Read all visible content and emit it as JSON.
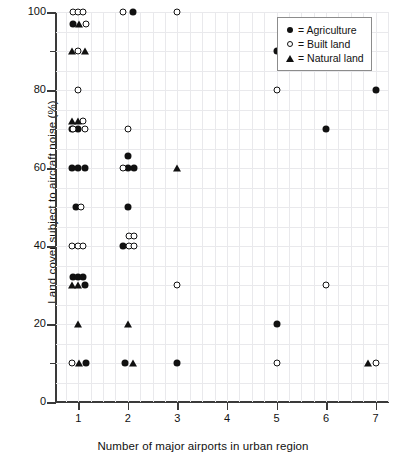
{
  "chart_data": {
    "type": "scatter",
    "title": "",
    "xlabel": "Number of major airports in urban region",
    "ylabel": "Land cover subject to aircraft noise (%)",
    "xlim": [
      0.55,
      7.25
    ],
    "ylim": [
      0,
      100
    ],
    "grid": true,
    "x_ticks": [
      1,
      2,
      3,
      4,
      5,
      6,
      7
    ],
    "x_tick_labels": [
      "1",
      "2",
      "3",
      "4",
      "5",
      "6",
      "7"
    ],
    "y_ticks": [
      0,
      20,
      40,
      60,
      80,
      100
    ],
    "y_tick_labels": [
      "0",
      "20",
      "40",
      "60",
      "80",
      "100"
    ],
    "y_minor_ticks": [
      10,
      30,
      50,
      70,
      90
    ],
    "legend_position": "top-right",
    "series": [
      {
        "name": "Agriculture",
        "marker": "filled-circle",
        "color": "#111111",
        "points": [
          {
            "x": 0.9,
            "y": 97
          },
          {
            "x": 0.87,
            "y": 70
          },
          {
            "x": 1.0,
            "y": 70
          },
          {
            "x": 0.87,
            "y": 60
          },
          {
            "x": 1.0,
            "y": 60
          },
          {
            "x": 1.13,
            "y": 60
          },
          {
            "x": 0.95,
            "y": 50
          },
          {
            "x": 0.9,
            "y": 32
          },
          {
            "x": 1.0,
            "y": 32
          },
          {
            "x": 1.1,
            "y": 32
          },
          {
            "x": 1.13,
            "y": 30
          },
          {
            "x": 1.15,
            "y": 10
          },
          {
            "x": 2.1,
            "y": 100
          },
          {
            "x": 2.0,
            "y": 63
          },
          {
            "x": 2.0,
            "y": 60
          },
          {
            "x": 2.12,
            "y": 60
          },
          {
            "x": 2.0,
            "y": 50
          },
          {
            "x": 1.9,
            "y": 40
          },
          {
            "x": 1.95,
            "y": 10
          },
          {
            "x": 3.0,
            "y": 10
          },
          {
            "x": 5.0,
            "y": 90
          },
          {
            "x": 5.0,
            "y": 20
          },
          {
            "x": 6.0,
            "y": 70
          },
          {
            "x": 7.0,
            "y": 80
          }
        ]
      },
      {
        "name": "Built land",
        "marker": "open-circle",
        "color": "#111111",
        "points": [
          {
            "x": 0.9,
            "y": 100
          },
          {
            "x": 1.0,
            "y": 100
          },
          {
            "x": 1.1,
            "y": 100
          },
          {
            "x": 1.15,
            "y": 97
          },
          {
            "x": 1.0,
            "y": 90
          },
          {
            "x": 1.0,
            "y": 80
          },
          {
            "x": 1.1,
            "y": 72
          },
          {
            "x": 0.9,
            "y": 70
          },
          {
            "x": 1.13,
            "y": 70
          },
          {
            "x": 1.05,
            "y": 50
          },
          {
            "x": 0.88,
            "y": 40
          },
          {
            "x": 0.99,
            "y": 40
          },
          {
            "x": 1.1,
            "y": 40
          },
          {
            "x": 0.88,
            "y": 10
          },
          {
            "x": 1.9,
            "y": 100
          },
          {
            "x": 2.0,
            "y": 70
          },
          {
            "x": 1.9,
            "y": 60
          },
          {
            "x": 2.02,
            "y": 42.5
          },
          {
            "x": 2.12,
            "y": 42.5
          },
          {
            "x": 2.02,
            "y": 40
          },
          {
            "x": 2.13,
            "y": 40
          },
          {
            "x": 3.0,
            "y": 100
          },
          {
            "x": 3.0,
            "y": 30
          },
          {
            "x": 5.0,
            "y": 80
          },
          {
            "x": 5.0,
            "y": 10
          },
          {
            "x": 6.0,
            "y": 30
          },
          {
            "x": 7.0,
            "y": 10
          }
        ]
      },
      {
        "name": "Natural land",
        "marker": "filled-triangle",
        "color": "#111111",
        "points": [
          {
            "x": 1.02,
            "y": 97
          },
          {
            "x": 0.88,
            "y": 90
          },
          {
            "x": 1.13,
            "y": 90
          },
          {
            "x": 0.88,
            "y": 72
          },
          {
            "x": 1.0,
            "y": 72
          },
          {
            "x": 0.88,
            "y": 30
          },
          {
            "x": 1.0,
            "y": 30
          },
          {
            "x": 1.0,
            "y": 20
          },
          {
            "x": 1.02,
            "y": 10
          },
          {
            "x": 2.0,
            "y": 20
          },
          {
            "x": 2.1,
            "y": 10
          },
          {
            "x": 3.0,
            "y": 60
          },
          {
            "x": 6.85,
            "y": 10
          }
        ]
      }
    ]
  },
  "legend": {
    "items": [
      {
        "label": "= Agriculture",
        "marker": "filled-circle"
      },
      {
        "label": "= Built land",
        "marker": "open-circle"
      },
      {
        "label": "= Natural land",
        "marker": "filled-triangle"
      }
    ]
  }
}
